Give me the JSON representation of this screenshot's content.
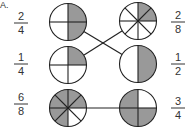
{
  "section_label": "A.",
  "colors": {
    "shaded": "#999999",
    "unshaded": "#ffffff",
    "stroke": "#222222"
  },
  "left_column": [
    {
      "id": "left-1",
      "numerator": "2",
      "denominator": "4",
      "parts": 4,
      "shaded_parts": [
        0,
        1
      ],
      "shaded_description": "top half (top-left and top-right quarters)"
    },
    {
      "id": "left-2",
      "numerator": "1",
      "denominator": "4",
      "parts": 4,
      "shaded_parts": [
        0
      ],
      "shaded_description": "top-right quarter"
    },
    {
      "id": "left-3",
      "numerator": "6",
      "denominator": "8",
      "parts": 8,
      "shaded_parts": [
        0,
        1,
        4,
        5,
        6,
        7
      ],
      "shaded_description": "all eighths except the two in the lower-right quadrant"
    }
  ],
  "right_column": [
    {
      "id": "right-1",
      "numerator": "2",
      "denominator": "8",
      "parts": 8,
      "shaded_parts": [
        0,
        1
      ],
      "shaded_description": "two eighths in the upper-right quadrant"
    },
    {
      "id": "right-2",
      "numerator": "1",
      "denominator": "2",
      "parts": 2,
      "shaded_parts": [
        0
      ],
      "shaded_description": "right half"
    },
    {
      "id": "right-3",
      "numerator": "3",
      "denominator": "4",
      "parts": 4,
      "shaded_parts": [
        1,
        2,
        3
      ],
      "shaded_description": "all quarters except top-right"
    }
  ],
  "matches": [
    {
      "from": "left-1",
      "to": "right-2"
    },
    {
      "from": "left-2",
      "to": "right-1"
    },
    {
      "from": "left-3",
      "to": "right-3"
    }
  ]
}
